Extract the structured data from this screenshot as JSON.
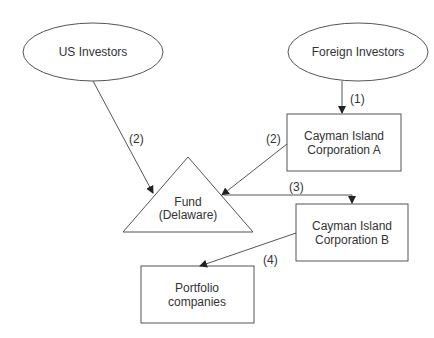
{
  "nodes": {
    "us_investors": "US Investors",
    "foreign_investors": "Foreign Investors",
    "cayman_a": [
      "Cayman Island",
      "Corporation A"
    ],
    "fund": [
      "Fund",
      "(Delaware)"
    ],
    "cayman_b": [
      "Cayman Island",
      "Corporation B"
    ],
    "portfolio": [
      "Portfolio",
      "companies"
    ]
  },
  "edges": {
    "foreign_to_cayman_a": "(1)",
    "us_to_fund": "(2)",
    "cayman_a_to_fund": "(2)",
    "fund_to_cayman_b": "(3)",
    "cayman_b_to_portfolio": "(4)"
  },
  "colors": {
    "stroke": "#555555",
    "text": "#333333"
  }
}
